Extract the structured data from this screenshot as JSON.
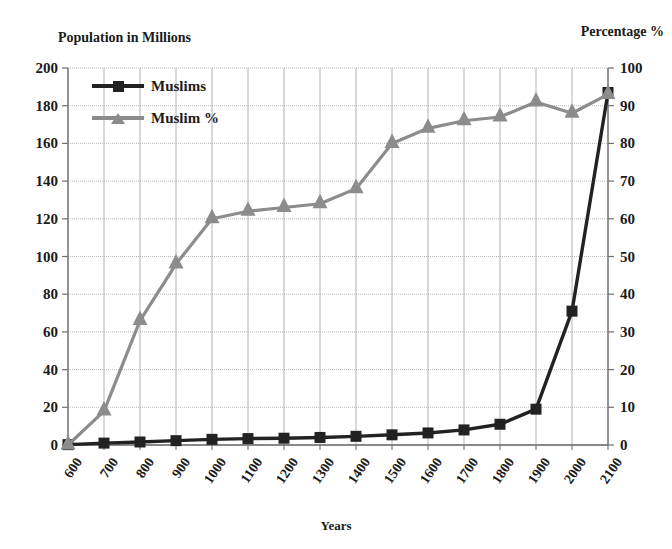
{
  "chart_data": {
    "type": "line",
    "title": "",
    "xlabel": "Years",
    "ylabel": "Population in Millions",
    "y2label": "Percentage %",
    "categories": [
      "600",
      "700",
      "800",
      "900",
      "1000",
      "1100",
      "1200",
      "1300",
      "1400",
      "1500",
      "1600",
      "1700",
      "1800",
      "1900",
      "2000",
      "2100"
    ],
    "x_tick_labels": [
      "600",
      "700",
      "800",
      "900",
      "1000",
      "1100",
      "1200",
      "1300",
      "1400",
      "1500",
      "1600",
      "1700",
      "1800",
      "1900",
      "2000",
      "2100"
    ],
    "y_tick_labels": [
      "0",
      "20",
      "40",
      "60",
      "80",
      "100",
      "120",
      "140",
      "160",
      "180",
      "200"
    ],
    "y_ticks": [
      0,
      20,
      40,
      60,
      80,
      100,
      120,
      140,
      160,
      180,
      200
    ],
    "ylim": [
      0,
      200
    ],
    "y2_tick_labels": [
      "0",
      "10",
      "20",
      "30",
      "40",
      "50",
      "60",
      "70",
      "80",
      "90",
      "100"
    ],
    "y2_ticks": [
      0,
      10,
      20,
      30,
      40,
      50,
      60,
      70,
      80,
      90,
      100
    ],
    "y2lim": [
      0,
      100
    ],
    "grid": true,
    "legend_position": "top-left",
    "series": [
      {
        "name": "Muslims",
        "axis": "left",
        "color": "#222222",
        "marker": "square",
        "values": [
          0.2,
          1.0,
          1.6,
          2.3,
          3.0,
          3.4,
          3.6,
          4.0,
          4.6,
          5.4,
          6.4,
          8.0,
          11.0,
          19.0,
          71.0,
          187.0
        ]
      },
      {
        "name": "Muslim %",
        "axis": "right",
        "color": "#8c8c8c",
        "marker": "triangle",
        "values": [
          0,
          9,
          33,
          48,
          60,
          62,
          63,
          64,
          68,
          80,
          84,
          86,
          87,
          91,
          88,
          93
        ]
      }
    ]
  },
  "labels": {
    "left_axis_caption": "Population in Millions",
    "right_axis_caption": "Percentage %",
    "x_axis_title": "Years"
  },
  "legend": {
    "items": [
      {
        "label": "Muslims",
        "color": "#222222",
        "marker": "square-marker"
      },
      {
        "label": "Muslim %",
        "color": "#8c8c8c",
        "marker": "triangle-marker"
      }
    ]
  },
  "colors": {
    "muslims_series": "#222222",
    "muslim_pct_series": "#8c8c8c",
    "grid": "#aaaaaa",
    "axis": "#6f6f6f",
    "text": "#1a1a1a",
    "background": "#ffffff"
  }
}
